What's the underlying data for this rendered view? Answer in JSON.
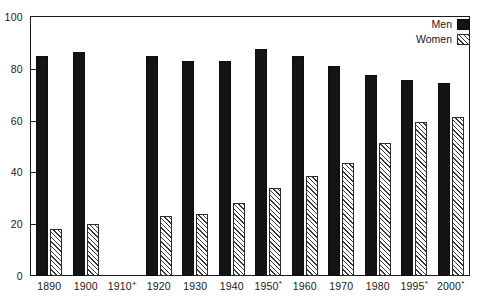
{
  "chart_data": {
    "type": "bar",
    "title": "",
    "xlabel": "",
    "ylabel": "",
    "ylim": [
      0,
      100
    ],
    "yticks": [
      0,
      20,
      40,
      60,
      80,
      100
    ],
    "grid": false,
    "legend_position": "top-right",
    "categories": [
      "1890",
      "1900",
      "1910⁺",
      "1920",
      "1930",
      "1940",
      "1950*",
      "1960",
      "1970",
      "1980",
      "1995*",
      "2000*"
    ],
    "series": [
      {
        "name": "Men",
        "pattern": "solid-black",
        "color": "#141414",
        "values": [
          85,
          86.5,
          null,
          85,
          83,
          83,
          87.5,
          85,
          81,
          77.5,
          75.5,
          74.5
        ]
      },
      {
        "name": "Women",
        "pattern": "diagonal-hatch",
        "color": "#3a3a3a",
        "values": [
          18,
          20,
          null,
          23,
          24,
          28,
          34,
          38.5,
          43.5,
          51.5,
          59.5,
          61.5
        ]
      }
    ],
    "notes": {
      "missing_category": "1910⁺",
      "missing_reason_marker": "⁺"
    }
  },
  "legend": {
    "items": [
      {
        "label": "Men",
        "swatch": "solid-black-swatch"
      },
      {
        "label": "Women",
        "swatch": "hatched-swatch"
      }
    ]
  },
  "axis": {
    "y_labels": [
      "100",
      "80",
      "60",
      "40",
      "20",
      "0"
    ],
    "x_labels": [
      {
        "text": "1890",
        "sup": ""
      },
      {
        "text": "1900",
        "sup": ""
      },
      {
        "text": "1910",
        "sup": "+"
      },
      {
        "text": "1920",
        "sup": ""
      },
      {
        "text": "1930",
        "sup": ""
      },
      {
        "text": "1940",
        "sup": ""
      },
      {
        "text": "1950",
        "sup": "*"
      },
      {
        "text": "1960",
        "sup": ""
      },
      {
        "text": "1970",
        "sup": ""
      },
      {
        "text": "1980",
        "sup": ""
      },
      {
        "text": "1995",
        "sup": "*"
      },
      {
        "text": "2000",
        "sup": "*"
      }
    ]
  },
  "top_clip_text": ""
}
